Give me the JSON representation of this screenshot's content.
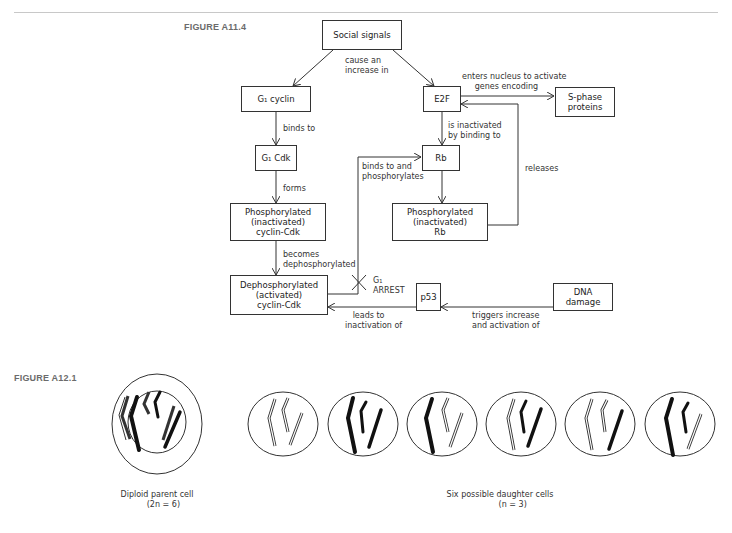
{
  "figures": {
    "top": {
      "label": "FIGURE A11.4",
      "boxes": {
        "social_signals": "Social signals",
        "g1_cyclin": "G₁ cyclin",
        "e2f": "E2F",
        "s_phase_proteins": "S-phase\nproteins",
        "g1_cdk": "G₁ Cdk",
        "rb": "Rb",
        "phos_cyclin_cdk": "Phosphorylated\n(inactivated)\ncyclin-Cdk",
        "phos_rb": "Phosphorylated\n(inactivated)\nRb",
        "dephos_cyclin_cdk": "Dephosphorylated\n(activated)\ncyclin-Cdk",
        "p53": "p53",
        "dna_damage": "DNA\ndamage"
      },
      "labels": {
        "cause_increase": "cause an\nincrease in",
        "enters_nucleus": "enters nucleus to activate\n     genes encoding",
        "binds_to": "binds to",
        "is_inactivated": "is inactivated\nby binding to",
        "binds_phosphorylates": "binds to and\nphosphorylates",
        "releases": "releases",
        "forms": "forms",
        "becomes_dephos": "becomes\ndephosphorylated",
        "g1_arrest": "G₁\nARREST",
        "leads_to": "   leads to\ninactivation of",
        "triggers": "triggers increase\nand activation of"
      }
    },
    "bottom": {
      "label": "FIGURE A12.1",
      "parent_caption": "Diploid parent cell\n     (2n = 6)",
      "daughters_caption": "Six possible daughter cells\n          (n = 3)"
    }
  }
}
